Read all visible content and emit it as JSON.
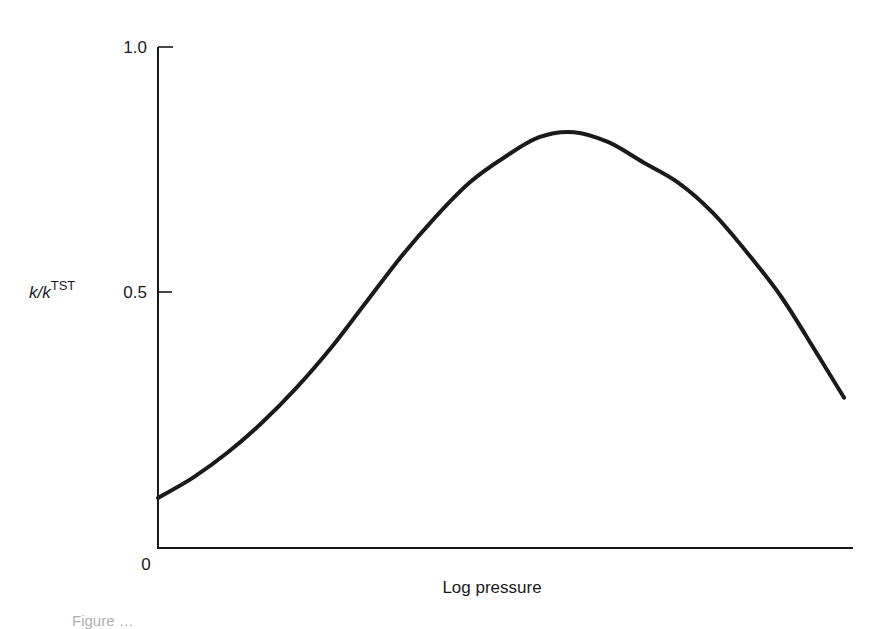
{
  "chart_data": {
    "type": "line",
    "title": "",
    "xlabel": "Log pressure",
    "ylabel": "k/k^TST",
    "ylabel_parts": {
      "base": "k/k",
      "superscript": "TST"
    },
    "ylim": [
      0,
      1.0
    ],
    "yticks": [
      0,
      0.5,
      1.0
    ],
    "ytick_labels": [
      "0",
      "0.5",
      "1.0"
    ],
    "xticks": [],
    "grid": false,
    "legend": null,
    "x_units": "relative log pressure (unlabeled, 0 to 1)",
    "series": [
      {
        "name": "k/k^TST",
        "x": [
          0.0,
          0.05,
          0.1,
          0.15,
          0.2,
          0.25,
          0.3,
          0.35,
          0.4,
          0.45,
          0.5,
          0.55,
          0.6,
          0.65,
          0.7,
          0.75,
          0.8,
          0.85,
          0.9,
          0.95,
          0.99
        ],
        "values": [
          0.1,
          0.14,
          0.19,
          0.25,
          0.32,
          0.4,
          0.49,
          0.58,
          0.66,
          0.73,
          0.78,
          0.82,
          0.83,
          0.81,
          0.77,
          0.73,
          0.67,
          0.59,
          0.5,
          0.39,
          0.3
        ]
      }
    ],
    "annotations": []
  },
  "caption": {
    "partial_text": "Figure …"
  }
}
